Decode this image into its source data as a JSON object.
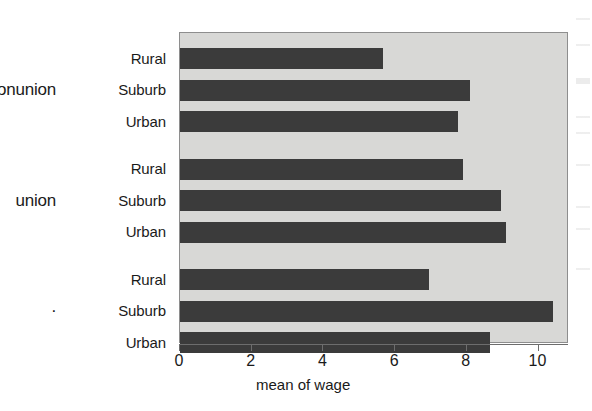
{
  "chart_data": {
    "type": "bar",
    "orientation": "horizontal",
    "title": "",
    "xlabel": "mean of wage",
    "ylabel": "",
    "xlim": [
      0,
      10.85
    ],
    "xticks": [
      0,
      2,
      4,
      6,
      8,
      10
    ],
    "xtick_labels": [
      "0",
      "2",
      "4",
      "6",
      "8",
      "10"
    ],
    "grid": false,
    "legend": null,
    "panel_background": "#d8d8d6",
    "bar_color": "#3b3b3b",
    "groups": [
      {
        "label": "nonunion",
        "categories": [
          "Rural",
          "Suburb",
          "Urban"
        ],
        "values": [
          5.65,
          8.1,
          7.75
        ]
      },
      {
        "label": "union",
        "categories": [
          "Rural",
          "Suburb",
          "Urban"
        ],
        "values": [
          7.9,
          8.95,
          9.1
        ]
      },
      {
        "label": ".",
        "categories": [
          "Rural",
          "Suburb",
          "Urban"
        ],
        "values": [
          6.95,
          10.4,
          8.65
        ]
      }
    ],
    "categories_flat": [
      "Rural",
      "Suburb",
      "Urban",
      "Rural",
      "Suburb",
      "Urban",
      "Rural",
      "Suburb",
      "Urban"
    ],
    "values_flat": [
      5.65,
      8.1,
      7.75,
      7.9,
      8.95,
      9.1,
      6.95,
      10.4,
      8.65
    ]
  }
}
